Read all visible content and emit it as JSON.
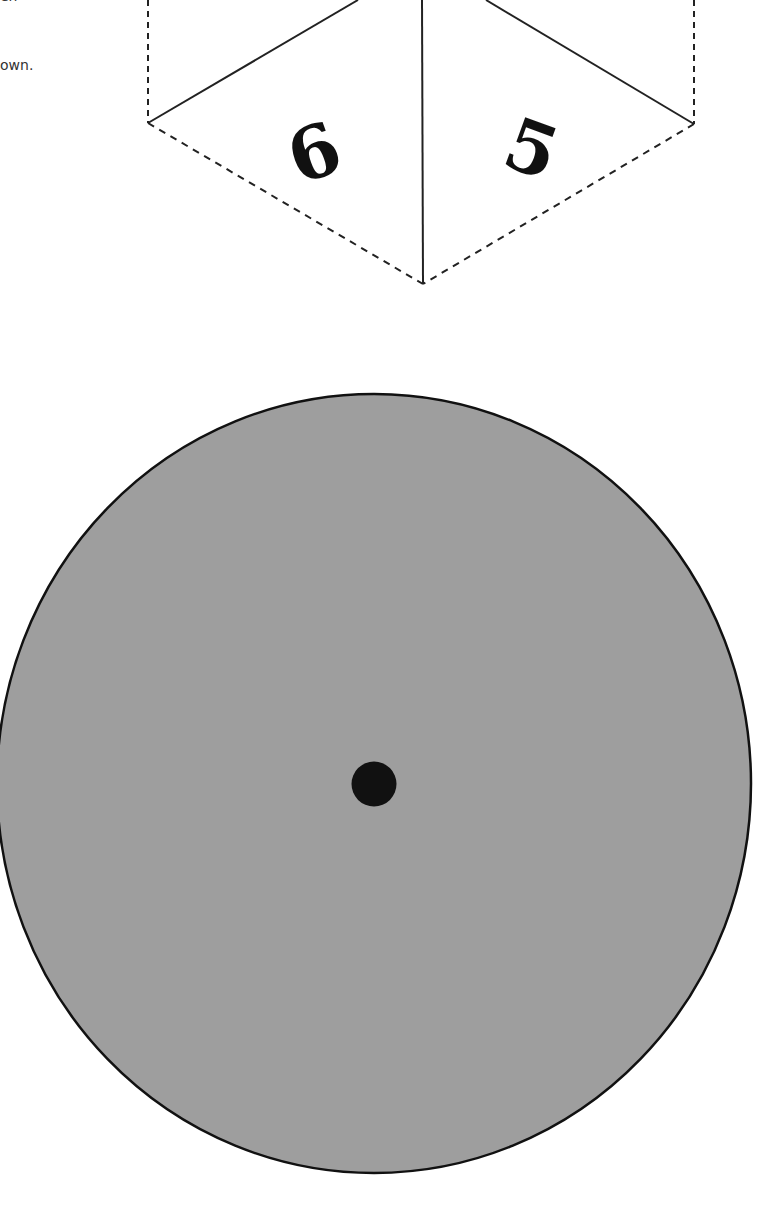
{
  "instructions": {
    "line_top_fragment": "en",
    "line_bottom_fragment": "own."
  },
  "template": {
    "hexagon": {
      "faces": [
        {
          "label": "6",
          "position": "bottom-left"
        },
        {
          "label": "5",
          "position": "bottom-right"
        }
      ],
      "fold_lines": "solid",
      "cut_lines": "dashed"
    },
    "spinner_disc": {
      "fill_color": "#9e9e9e",
      "outline_color": "#111111",
      "center_hole_color": "#111111"
    }
  }
}
